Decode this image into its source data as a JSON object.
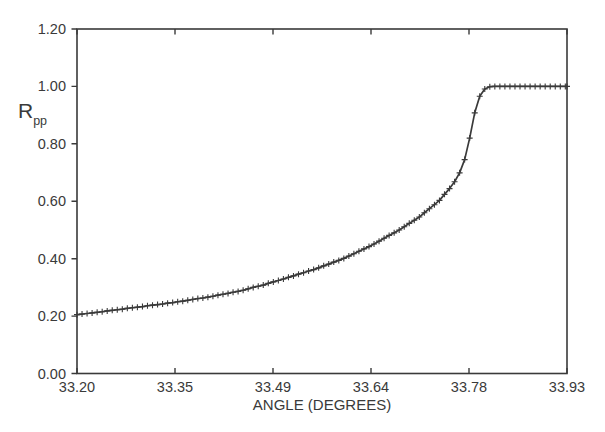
{
  "figure": {
    "background": "#ffffff",
    "ink_color": "#3a3a3a",
    "y_axis_label_base": "R",
    "y_axis_label_sub": "pp"
  },
  "chart_data": {
    "type": "line",
    "title": "",
    "xlabel": "ANGLE (DEGREES)",
    "ylabel": "Rpp",
    "xlim": [
      33.2,
      33.93
    ],
    "ylim": [
      0.0,
      1.2
    ],
    "grid": false,
    "legend": "none",
    "frame": "box",
    "marker": "plus",
    "marker_size": 6,
    "line_color": "#3a3a3a",
    "x_tick_values": [
      33.2,
      33.346,
      33.492,
      33.638,
      33.784,
      33.93
    ],
    "x_tick_labels": [
      "33.20",
      "33.35",
      "33.49",
      "33.64",
      "33.78",
      "33.93"
    ],
    "y_tick_values": [
      0.0,
      0.2,
      0.4,
      0.6,
      0.8,
      1.0,
      1.2
    ],
    "y_tick_labels": [
      "0.00",
      "0.20",
      "0.40",
      "0.60",
      "0.80",
      "1.00",
      "1.20"
    ],
    "series": [
      {
        "name": "Rpp",
        "points": [
          [
            33.2,
            0.205
          ],
          [
            33.2075,
            0.207
          ],
          [
            33.215,
            0.209
          ],
          [
            33.2225,
            0.211
          ],
          [
            33.23,
            0.213
          ],
          [
            33.2375,
            0.215
          ],
          [
            33.245,
            0.218
          ],
          [
            33.2525,
            0.22
          ],
          [
            33.26,
            0.222
          ],
          [
            33.2675,
            0.224
          ],
          [
            33.275,
            0.227
          ],
          [
            33.2825,
            0.229
          ],
          [
            33.29,
            0.231
          ],
          [
            33.2975,
            0.233
          ],
          [
            33.305,
            0.236
          ],
          [
            33.3125,
            0.238
          ],
          [
            33.32,
            0.24
          ],
          [
            33.3275,
            0.242
          ],
          [
            33.335,
            0.245
          ],
          [
            33.3425,
            0.247
          ],
          [
            33.35,
            0.25
          ],
          [
            33.3575,
            0.252
          ],
          [
            33.365,
            0.255
          ],
          [
            33.3725,
            0.258
          ],
          [
            33.38,
            0.261
          ],
          [
            33.3875,
            0.263
          ],
          [
            33.395,
            0.266
          ],
          [
            33.4025,
            0.269
          ],
          [
            33.41,
            0.273
          ],
          [
            33.4175,
            0.276
          ],
          [
            33.425,
            0.279
          ],
          [
            33.4325,
            0.283
          ],
          [
            33.44,
            0.286
          ],
          [
            33.4475,
            0.29
          ],
          [
            33.455,
            0.295
          ],
          [
            33.4625,
            0.3
          ],
          [
            33.47,
            0.304
          ],
          [
            33.4775,
            0.308
          ],
          [
            33.485,
            0.314
          ],
          [
            33.4925,
            0.319
          ],
          [
            33.5,
            0.324
          ],
          [
            33.5075,
            0.329
          ],
          [
            33.515,
            0.335
          ],
          [
            33.5225,
            0.34
          ],
          [
            33.53,
            0.346
          ],
          [
            33.5375,
            0.351
          ],
          [
            33.545,
            0.357
          ],
          [
            33.5525,
            0.362
          ],
          [
            33.56,
            0.368
          ],
          [
            33.5675,
            0.375
          ],
          [
            33.575,
            0.381
          ],
          [
            33.5825,
            0.388
          ],
          [
            33.59,
            0.394
          ],
          [
            33.5975,
            0.401
          ],
          [
            33.605,
            0.409
          ],
          [
            33.6125,
            0.417
          ],
          [
            33.62,
            0.426
          ],
          [
            33.6275,
            0.434
          ],
          [
            33.635,
            0.442
          ],
          [
            33.6425,
            0.451
          ],
          [
            33.65,
            0.461
          ],
          [
            33.6575,
            0.471
          ],
          [
            33.665,
            0.481
          ],
          [
            33.6725,
            0.49
          ],
          [
            33.68,
            0.5
          ],
          [
            33.6875,
            0.511
          ],
          [
            33.695,
            0.523
          ],
          [
            33.7025,
            0.534
          ],
          [
            33.71,
            0.545
          ],
          [
            33.7175,
            0.56
          ],
          [
            33.725,
            0.574
          ],
          [
            33.7325,
            0.588
          ],
          [
            33.74,
            0.603
          ],
          [
            33.7475,
            0.624
          ],
          [
            33.755,
            0.644
          ],
          [
            33.7625,
            0.668
          ],
          [
            33.77,
            0.699
          ],
          [
            33.7775,
            0.745
          ],
          [
            33.785,
            0.82
          ],
          [
            33.7925,
            0.908
          ],
          [
            33.8,
            0.966
          ],
          [
            33.8075,
            0.991
          ],
          [
            33.815,
            0.999
          ],
          [
            33.8225,
            1.0
          ],
          [
            33.83,
            1.0
          ],
          [
            33.8375,
            1.0
          ],
          [
            33.845,
            1.0
          ],
          [
            33.8525,
            1.0
          ],
          [
            33.86,
            1.0
          ],
          [
            33.8675,
            1.0
          ],
          [
            33.875,
            1.0
          ],
          [
            33.8825,
            1.0
          ],
          [
            33.89,
            1.0
          ],
          [
            33.8975,
            1.0
          ],
          [
            33.905,
            1.0
          ],
          [
            33.9125,
            1.0
          ],
          [
            33.92,
            1.0
          ],
          [
            33.9275,
            1.0
          ],
          [
            33.93,
            1.0
          ]
        ]
      }
    ]
  }
}
